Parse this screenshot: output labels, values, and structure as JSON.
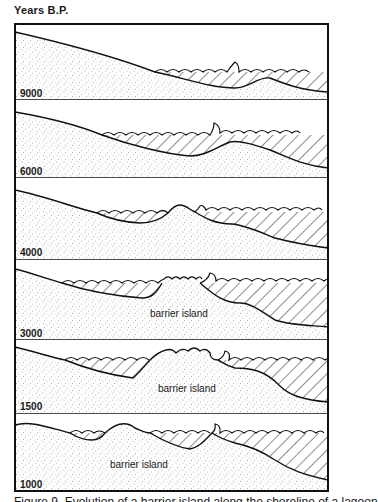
{
  "figure": {
    "axis_title": "Years B.P.",
    "caption": "Figure 9. Evolution of a barrier island along the shoreline of a lagoon",
    "panels": [
      {
        "years": "9000",
        "label": ""
      },
      {
        "years": "6000",
        "label": ""
      },
      {
        "years": "4000",
        "label": ""
      },
      {
        "years": "3000",
        "label": "barrier island"
      },
      {
        "years": "1500",
        "label": "barrier island"
      },
      {
        "years": "1000",
        "label": "barrier island"
      }
    ],
    "legend": {
      "stippled": "sand / sediment",
      "hatched": "water (lagoon / sea)"
    }
  }
}
